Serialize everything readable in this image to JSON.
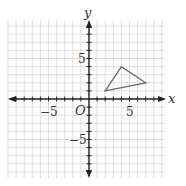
{
  "chart_data": {
    "type": "coordinate-plane",
    "xlabel": "x",
    "ylabel": "y",
    "origin_label": "O",
    "xlim": [
      -10,
      9
    ],
    "ylim": [
      -10,
      10
    ],
    "grid": true,
    "tick_labels": {
      "x": [
        "-5",
        "5"
      ],
      "y": [
        "5",
        "-5"
      ]
    },
    "shapes": [
      {
        "type": "triangle",
        "vertices": [
          [
            2,
            1
          ],
          [
            4,
            4
          ],
          [
            7,
            2
          ]
        ],
        "color": "#666666"
      }
    ]
  },
  "labels": {
    "x_axis": "x",
    "y_axis": "y",
    "origin": "O",
    "x_neg5": "−5",
    "x_pos5": "5",
    "y_pos5": "5",
    "y_neg5": "−5"
  }
}
